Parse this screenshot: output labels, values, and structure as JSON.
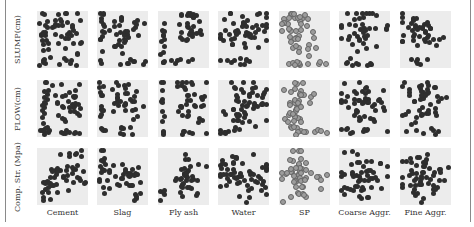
{
  "chart_data": {
    "type": "scatter",
    "title": "",
    "layout": "scatter-plot matrix (3 rows x 7 columns)",
    "row_labels": [
      "SLUMP(cm)",
      "FLOW(cm)",
      "Comp. Str. (Mpa)"
    ],
    "column_labels": [
      "Cement",
      "Slag",
      "Fly ash",
      "Water",
      "SP",
      "Coarse Aggr.",
      "Fine Aggr."
    ],
    "grid": false,
    "panel_background": "#ececec",
    "point_color": "#2e2e2e",
    "highlight_column": "SP",
    "highlight_point_color": "#9c9c9c",
    "panels": [
      [
        {
          "clusters": [
            [
              0.15,
              0.35,
              0.06,
              0.25,
              18
            ],
            [
              0.62,
              0.3,
              0.16,
              0.18,
              30
            ],
            [
              0.2,
              0.9,
              0.1,
              0.04,
              6
            ],
            [
              0.55,
              0.9,
              0.15,
              0.04,
              6
            ],
            [
              0.75,
              0.7,
              0.05,
              0.05,
              2
            ]
          ]
        },
        {
          "clusters": [
            [
              0.1,
              0.3,
              0.03,
              0.25,
              14
            ],
            [
              0.55,
              0.3,
              0.18,
              0.15,
              28
            ],
            [
              0.45,
              0.7,
              0.05,
              0.05,
              3
            ],
            [
              0.7,
              0.9,
              0.15,
              0.04,
              8
            ],
            [
              0.1,
              0.9,
              0.02,
              0.02,
              1
            ]
          ]
        },
        {
          "clusters": [
            [
              0.1,
              0.45,
              0.02,
              0.3,
              12
            ],
            [
              0.62,
              0.3,
              0.18,
              0.2,
              30
            ],
            [
              0.6,
              0.9,
              0.15,
              0.04,
              6
            ],
            [
              0.1,
              0.9,
              0.02,
              0.04,
              2
            ]
          ]
        },
        {
          "clusters": [
            [
              0.55,
              0.3,
              0.3,
              0.15,
              40
            ],
            [
              0.3,
              0.5,
              0.2,
              0.1,
              10
            ],
            [
              0.2,
              0.9,
              0.15,
              0.04,
              8
            ],
            [
              0.55,
              0.85,
              0.05,
              0.03,
              2
            ]
          ]
        },
        {
          "clusters": [
            [
              0.35,
              0.3,
              0.18,
              0.2,
              35
            ],
            [
              0.5,
              0.6,
              0.08,
              0.08,
              5
            ],
            [
              0.35,
              0.92,
              0.15,
              0.03,
              8
            ],
            [
              0.85,
              0.9,
              0.07,
              0.04,
              3
            ]
          ]
        },
        {
          "clusters": [
            [
              0.45,
              0.3,
              0.3,
              0.15,
              35
            ],
            [
              0.3,
              0.55,
              0.1,
              0.08,
              5
            ],
            [
              0.5,
              0.9,
              0.2,
              0.04,
              8
            ],
            [
              0.15,
              0.88,
              0.05,
              0.03,
              2
            ]
          ]
        },
        {
          "clusters": [
            [
              0.35,
              0.3,
              0.2,
              0.15,
              30
            ],
            [
              0.5,
              0.55,
              0.25,
              0.1,
              8
            ],
            [
              0.75,
              0.45,
              0.1,
              0.05,
              3
            ],
            [
              0.4,
              0.88,
              0.15,
              0.05,
              6
            ]
          ]
        }
      ],
      [
        {
          "clusters": [
            [
              0.15,
              0.45,
              0.05,
              0.3,
              18
            ],
            [
              0.62,
              0.35,
              0.15,
              0.18,
              30
            ],
            [
              0.15,
              0.9,
              0.08,
              0.03,
              5
            ],
            [
              0.6,
              0.9,
              0.15,
              0.03,
              8
            ],
            [
              0.35,
              0.15,
              0.05,
              0.05,
              2
            ]
          ]
        },
        {
          "clusters": [
            [
              0.1,
              0.45,
              0.03,
              0.32,
              14
            ],
            [
              0.55,
              0.35,
              0.15,
              0.18,
              28
            ],
            [
              0.5,
              0.9,
              0.15,
              0.04,
              8
            ],
            [
              0.8,
              0.6,
              0.05,
              0.08,
              3
            ]
          ]
        },
        {
          "clusters": [
            [
              0.1,
              0.5,
              0.02,
              0.3,
              12
            ],
            [
              0.55,
              0.35,
              0.12,
              0.18,
              24
            ],
            [
              0.85,
              0.45,
              0.05,
              0.25,
              10
            ],
            [
              0.6,
              0.9,
              0.15,
              0.04,
              6
            ]
          ]
        },
        {
          "clusters": [
            [
              0.55,
              0.35,
              0.25,
              0.18,
              40
            ],
            [
              0.35,
              0.55,
              0.12,
              0.1,
              10
            ],
            [
              0.2,
              0.9,
              0.12,
              0.03,
              8
            ],
            [
              0.55,
              0.75,
              0.12,
              0.08,
              4
            ]
          ]
        },
        {
          "clusters": [
            [
              0.35,
              0.4,
              0.15,
              0.25,
              40
            ],
            [
              0.3,
              0.8,
              0.1,
              0.05,
              5
            ],
            [
              0.45,
              0.92,
              0.15,
              0.03,
              6
            ],
            [
              0.85,
              0.9,
              0.07,
              0.03,
              3
            ]
          ]
        },
        {
          "clusters": [
            [
              0.45,
              0.35,
              0.28,
              0.18,
              38
            ],
            [
              0.5,
              0.65,
              0.2,
              0.08,
              8
            ],
            [
              0.5,
              0.9,
              0.2,
              0.03,
              8
            ],
            [
              0.15,
              0.9,
              0.05,
              0.02,
              2
            ]
          ]
        },
        {
          "clusters": [
            [
              0.45,
              0.4,
              0.25,
              0.2,
              38
            ],
            [
              0.4,
              0.15,
              0.15,
              0.05,
              6
            ],
            [
              0.45,
              0.9,
              0.15,
              0.03,
              6
            ],
            [
              0.2,
              0.8,
              0.08,
              0.06,
              3
            ]
          ]
        }
      ],
      [
        {
          "clusters": [
            [
              0.2,
              0.6,
              0.08,
              0.12,
              16
            ],
            [
              0.65,
              0.4,
              0.15,
              0.2,
              30
            ],
            [
              0.2,
              0.9,
              0.05,
              0.03,
              3
            ],
            [
              0.35,
              0.35,
              0.07,
              0.05,
              3
            ]
          ]
        },
        {
          "clusters": [
            [
              0.1,
              0.45,
              0.03,
              0.25,
              14
            ],
            [
              0.6,
              0.5,
              0.18,
              0.15,
              30
            ],
            [
              0.75,
              0.9,
              0.08,
              0.03,
              3
            ],
            [
              0.3,
              0.35,
              0.05,
              0.05,
              3
            ]
          ]
        },
        {
          "clusters": [
            [
              0.1,
              0.75,
              0.02,
              0.12,
              5
            ],
            [
              0.6,
              0.5,
              0.18,
              0.18,
              35
            ],
            [
              0.6,
              0.15,
              0.05,
              0.05,
              2
            ]
          ]
        },
        {
          "clusters": [
            [
              0.55,
              0.5,
              0.3,
              0.15,
              45
            ],
            [
              0.25,
              0.4,
              0.12,
              0.15,
              12
            ],
            [
              0.4,
              0.9,
              0.1,
              0.03,
              3
            ],
            [
              0.1,
              0.2,
              0.03,
              0.03,
              1
            ]
          ]
        },
        {
          "clusters": [
            [
              0.35,
              0.45,
              0.18,
              0.22,
              42
            ],
            [
              0.8,
              0.45,
              0.08,
              0.06,
              4
            ],
            [
              0.45,
              0.85,
              0.05,
              0.05,
              3
            ]
          ]
        },
        {
          "clusters": [
            [
              0.5,
              0.5,
              0.28,
              0.15,
              45
            ],
            [
              0.55,
              0.2,
              0.1,
              0.08,
              4
            ],
            [
              0.6,
              0.88,
              0.15,
              0.03,
              4
            ]
          ]
        },
        {
          "clusters": [
            [
              0.4,
              0.5,
              0.22,
              0.15,
              45
            ],
            [
              0.5,
              0.2,
              0.1,
              0.08,
              5
            ],
            [
              0.8,
              0.7,
              0.08,
              0.08,
              4
            ],
            [
              0.45,
              0.88,
              0.08,
              0.03,
              3
            ]
          ]
        }
      ]
    ]
  },
  "layout_geometry": {
    "col_x": [
      37,
      97,
      158,
      218,
      279,
      339,
      400
    ],
    "row_y": [
      11,
      80,
      148
    ],
    "xlabel_y": 208
  }
}
